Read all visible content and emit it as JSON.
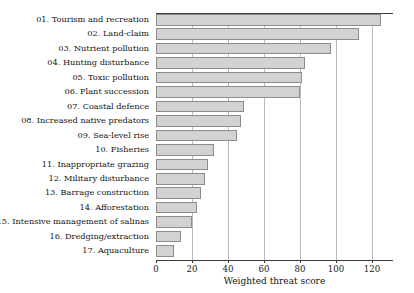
{
  "chart_data": {
    "type": "bar",
    "orientation": "horizontal",
    "title": "",
    "subtitle": "",
    "xlabel": "Weighted threat score",
    "ylabel": "",
    "xlim": [
      0,
      130
    ],
    "ylim": null,
    "grid": "vertical gridlines at each major x tick",
    "legend": null,
    "legend_position": "none",
    "xticks": [
      0,
      20,
      40,
      60,
      80,
      100,
      120
    ],
    "xtick_labels": [
      "0",
      "20",
      "40",
      "60",
      "80",
      "100",
      "120"
    ],
    "categories": [
      "01. Tourism and recreation",
      "02. Land-claim",
      "03. Nutrient pollution",
      "04. Hunting disturbance",
      "05. Toxic pollution",
      "06. Plant succession",
      "07. Coastal defence",
      "08. Increased native predators",
      "09. Sea-level rise",
      "10. Fisheries",
      "11. Inappropriate grazing",
      "12. Military disturbance",
      "13. Barrage construction",
      "14. Afforestation",
      "15. Intensive management of salinas",
      "16. Dredging/extraction",
      "17. Aquaculture"
    ],
    "values": [
      125,
      113,
      97,
      83,
      81,
      80,
      49,
      47,
      45,
      32,
      29,
      27,
      25,
      23,
      20,
      14,
      10
    ],
    "bar_fill_color": "#d2d2d2",
    "bar_edge_color": "#8d8d8d",
    "gridline_color": "#b9b9b9",
    "axis_color": "#3c3c3c"
  }
}
